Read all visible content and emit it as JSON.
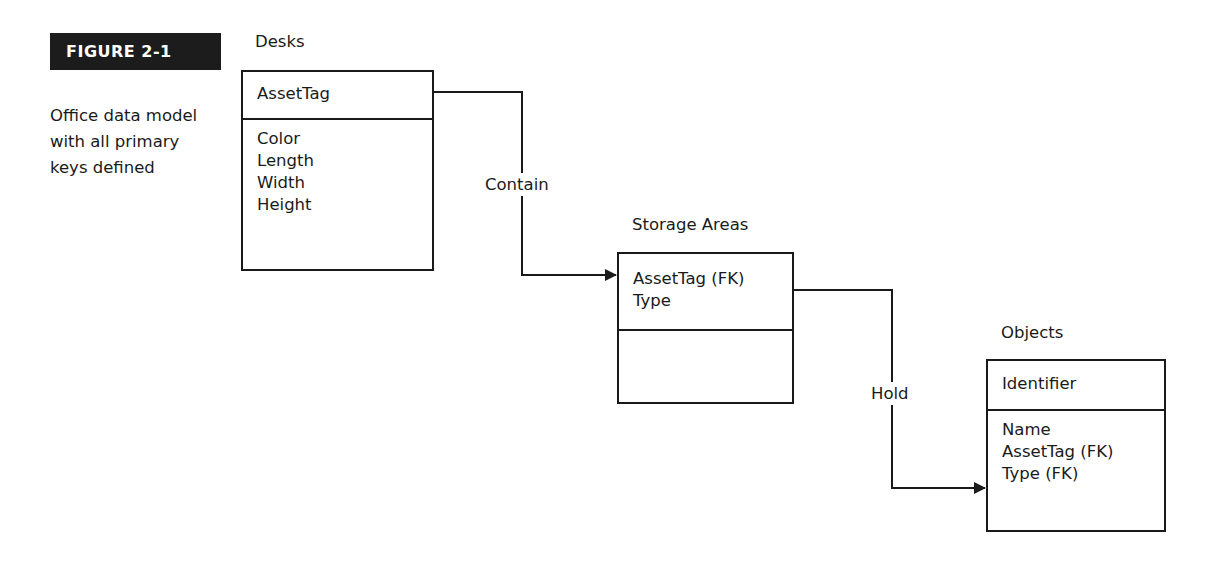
{
  "figure": {
    "label": "FIGURE 2-1",
    "caption_lines": [
      "Office data model",
      "with all primary",
      "keys defined"
    ]
  },
  "entities": [
    {
      "name": "Desks",
      "primary_keys": [
        "AssetTag"
      ],
      "attributes": [
        "Color",
        "Length",
        "Width",
        "Height"
      ]
    },
    {
      "name": "Storage Areas",
      "primary_keys": [
        "AssetTag (FK)",
        "Type"
      ],
      "attributes": []
    },
    {
      "name": "Objects",
      "primary_keys": [
        "Identifier"
      ],
      "attributes": [
        "Name",
        "AssetTag (FK)",
        "Type (FK)"
      ]
    }
  ],
  "relationships": [
    {
      "label": "Contain",
      "from": "Desks",
      "to": "Storage Areas"
    },
    {
      "label": "Hold",
      "from": "Storage Areas",
      "to": "Objects"
    }
  ],
  "colors": {
    "ink": "#1a1a1a",
    "label_bg": "#1c1c1c",
    "background": "#ffffff"
  }
}
